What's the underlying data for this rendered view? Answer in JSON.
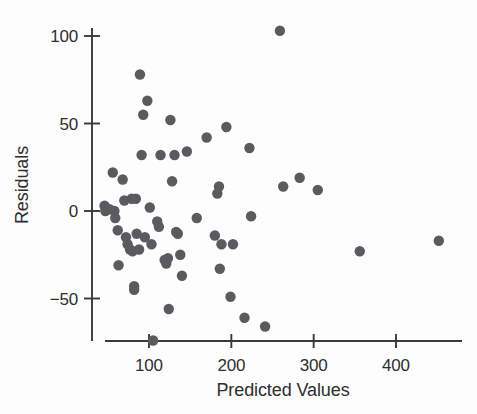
{
  "chart_data": {
    "type": "scatter",
    "title": "",
    "xlabel": "Predicted Values",
    "ylabel": "Residuals",
    "xlim": [
      38,
      470
    ],
    "ylim": [
      -82,
      112
    ],
    "xticks": [
      100,
      200,
      300,
      400
    ],
    "xtick_labels": [
      "100",
      "200",
      "300",
      "400"
    ],
    "yticks": [
      -50,
      0,
      50,
      100
    ],
    "ytick_labels": [
      "−50",
      "0",
      "50",
      "100"
    ],
    "grid": false,
    "legend": null,
    "marker_color": "#5b5b5f",
    "marker_size": 5.2,
    "axis_color": "#3a3a3a",
    "n_points": 73,
    "points": [
      {
        "x": 46,
        "y": 3
      },
      {
        "x": 47,
        "y": 0
      },
      {
        "x": 52,
        "y": 1
      },
      {
        "x": 56,
        "y": 22
      },
      {
        "x": 58,
        "y": 0
      },
      {
        "x": 59,
        "y": -4
      },
      {
        "x": 62,
        "y": -11
      },
      {
        "x": 63,
        "y": -31
      },
      {
        "x": 68,
        "y": 18
      },
      {
        "x": 70,
        "y": 6
      },
      {
        "x": 72,
        "y": -15
      },
      {
        "x": 74,
        "y": -19
      },
      {
        "x": 77,
        "y": -22
      },
      {
        "x": 79,
        "y": 7
      },
      {
        "x": 80,
        "y": -23
      },
      {
        "x": 82,
        "y": -43
      },
      {
        "x": 82,
        "y": -45
      },
      {
        "x": 84,
        "y": 7
      },
      {
        "x": 85,
        "y": -13
      },
      {
        "x": 88,
        "y": -22
      },
      {
        "x": 89,
        "y": 78
      },
      {
        "x": 91,
        "y": 32
      },
      {
        "x": 93,
        "y": 55
      },
      {
        "x": 95,
        "y": -15
      },
      {
        "x": 98,
        "y": 63
      },
      {
        "x": 101,
        "y": 2
      },
      {
        "x": 103,
        "y": -19
      },
      {
        "x": 105,
        "y": -74
      },
      {
        "x": 110,
        "y": -6
      },
      {
        "x": 112,
        "y": -9
      },
      {
        "x": 114,
        "y": 32
      },
      {
        "x": 119,
        "y": -28
      },
      {
        "x": 121,
        "y": -30
      },
      {
        "x": 123,
        "y": -27
      },
      {
        "x": 124,
        "y": -56
      },
      {
        "x": 126,
        "y": 52
      },
      {
        "x": 128,
        "y": 17
      },
      {
        "x": 131,
        "y": 32
      },
      {
        "x": 133,
        "y": -12
      },
      {
        "x": 135,
        "y": -13
      },
      {
        "x": 138,
        "y": -25
      },
      {
        "x": 140,
        "y": -37
      },
      {
        "x": 146,
        "y": 34
      },
      {
        "x": 158,
        "y": -4
      },
      {
        "x": 170,
        "y": 42
      },
      {
        "x": 180,
        "y": -14
      },
      {
        "x": 183,
        "y": 10
      },
      {
        "x": 185,
        "y": 14
      },
      {
        "x": 186,
        "y": -33
      },
      {
        "x": 188,
        "y": -19
      },
      {
        "x": 194,
        "y": 48
      },
      {
        "x": 199,
        "y": -49
      },
      {
        "x": 202,
        "y": -19
      },
      {
        "x": 216,
        "y": -61
      },
      {
        "x": 222,
        "y": 36
      },
      {
        "x": 224,
        "y": -3
      },
      {
        "x": 241,
        "y": -66
      },
      {
        "x": 259,
        "y": 103
      },
      {
        "x": 263,
        "y": 14
      },
      {
        "x": 283,
        "y": 19
      },
      {
        "x": 305,
        "y": 12
      },
      {
        "x": 356,
        "y": -23
      },
      {
        "x": 452,
        "y": -17
      }
    ]
  }
}
